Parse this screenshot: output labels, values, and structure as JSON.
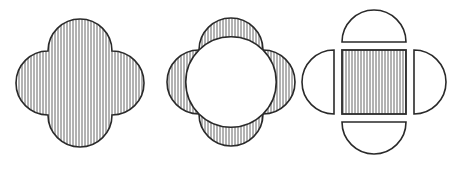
{
  "diagram": {
    "stroke_color": "#2a2a2a",
    "hatch_color": "#555555",
    "background": "#ffffff",
    "figures": [
      {
        "id": "quatrefoil",
        "label": "Hatched quatrefoil (union of square-centered circles)",
        "fill": "vertical-hatch"
      },
      {
        "id": "circle-with-lobes",
        "label": "Central white circle with four hatched lobes",
        "fill": "lobes-hatched"
      },
      {
        "id": "square-and-semicircles",
        "label": "Hatched square with four detached white semicircles",
        "fill": "square-hatched"
      }
    ]
  }
}
